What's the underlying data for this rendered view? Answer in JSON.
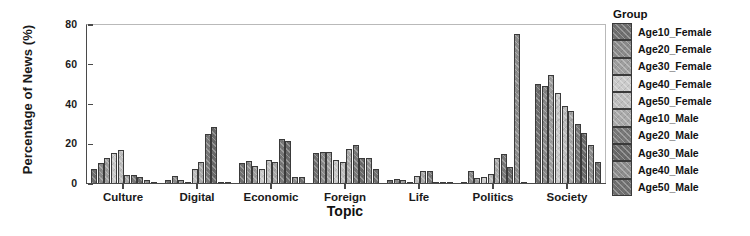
{
  "chart_data": {
    "type": "bar",
    "title": "",
    "xlabel": "Topic",
    "ylabel": "Percentage of News (%)",
    "categories": [
      "Culture",
      "Digital",
      "Economic",
      "Foreign",
      "Life",
      "Politics",
      "Society"
    ],
    "ylim": [
      0,
      80
    ],
    "yticks": [
      0,
      20,
      40,
      60,
      80
    ],
    "ytick_labels": [
      "0",
      "20",
      "40",
      "60",
      "80"
    ],
    "grid": false,
    "legend_title": "Group",
    "legend_position": "right",
    "series": [
      {
        "name": "Age10_Female",
        "color": "#6f6f6f",
        "values": [
          7.5,
          2.0,
          10.5,
          15.5,
          2.0,
          0.5,
          50.5
        ]
      },
      {
        "name": "Age20_Female",
        "color": "#8a8a8a",
        "values": [
          10.5,
          4.0,
          11.5,
          16.0,
          2.5,
          6.5,
          49.5
        ]
      },
      {
        "name": "Age30_Female",
        "color": "#9e9e9e",
        "values": [
          13.0,
          2.0,
          9.0,
          16.0,
          2.0,
          3.0,
          55.0
        ]
      },
      {
        "name": "Age40_Female",
        "color": "#c9c9c9",
        "values": [
          15.5,
          0.5,
          7.5,
          12.0,
          1.0,
          3.5,
          46.0
        ]
      },
      {
        "name": "Age50_Female",
        "color": "#bdbdbd",
        "values": [
          17.0,
          7.5,
          12.0,
          11.0,
          4.0,
          5.0,
          39.5
        ]
      },
      {
        "name": "Age10_Male",
        "color": "#a8a8a8",
        "values": [
          4.5,
          11.0,
          11.0,
          17.5,
          6.5,
          13.0,
          36.5
        ]
      },
      {
        "name": "Age20_Male",
        "color": "#787878",
        "values": [
          4.5,
          25.0,
          22.5,
          19.5,
          6.5,
          15.0,
          30.0
        ]
      },
      {
        "name": "Age30_Male",
        "color": "#6a6a6a",
        "values": [
          3.5,
          28.5,
          21.5,
          13.0,
          1.0,
          8.5,
          25.5
        ]
      },
      {
        "name": "Age40_Male",
        "color": "#8d8d8d",
        "values": [
          2.0,
          0.5,
          3.5,
          13.0,
          0.5,
          75.5,
          19.5
        ]
      },
      {
        "name": "Age50_Male",
        "color": "#707070",
        "values": [
          1.0,
          0.5,
          3.5,
          7.5,
          0.5,
          1.0,
          11.0
        ]
      }
    ]
  },
  "axis": {
    "y_title": "Percentage of News (%)",
    "x_title": "Topic"
  },
  "legend": {
    "title": "Group",
    "items": [
      {
        "label": "Age10_Female"
      },
      {
        "label": "Age20_Female"
      },
      {
        "label": "Age30_Female"
      },
      {
        "label": "Age40_Female"
      },
      {
        "label": "Age50_Female"
      },
      {
        "label": "Age10_Male"
      },
      {
        "label": "Age20_Male"
      },
      {
        "label": "Age30_Male"
      },
      {
        "label": "Age40_Male"
      },
      {
        "label": "Age50_Male"
      }
    ]
  }
}
